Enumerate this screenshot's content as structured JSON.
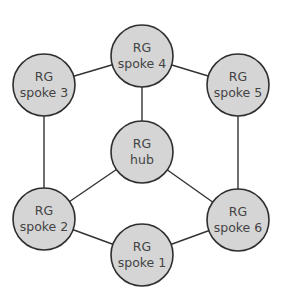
{
  "diagram": {
    "type": "network-topology",
    "style": {
      "node_fill": "#d5d5d5",
      "node_stroke": "#2e2e2e",
      "edge_color": "#333333",
      "text_color": "#444444",
      "background": "#ffffff"
    },
    "nodes": [
      {
        "id": "spoke4",
        "line1": "RG",
        "line2": "spoke 4",
        "cx": 142,
        "cy": 56
      },
      {
        "id": "spoke3",
        "line1": "RG",
        "line2": "spoke 3",
        "cx": 44,
        "cy": 85
      },
      {
        "id": "spoke5",
        "line1": "RG",
        "line2": "spoke 5",
        "cx": 238,
        "cy": 85
      },
      {
        "id": "hub",
        "line1": "RG",
        "line2": "hub",
        "cx": 142,
        "cy": 152
      },
      {
        "id": "spoke2",
        "line1": "RG",
        "line2": "spoke 2",
        "cx": 44,
        "cy": 219
      },
      {
        "id": "spoke6",
        "line1": "RG",
        "line2": "spoke 6",
        "cx": 238,
        "cy": 220
      },
      {
        "id": "spoke1",
        "line1": "RG",
        "line2": "spoke 1",
        "cx": 142,
        "cy": 255
      }
    ],
    "edges": [
      {
        "from": "spoke4",
        "to": "spoke3"
      },
      {
        "from": "spoke4",
        "to": "spoke5"
      },
      {
        "from": "spoke4",
        "to": "hub"
      },
      {
        "from": "spoke3",
        "to": "spoke2"
      },
      {
        "from": "spoke5",
        "to": "spoke6"
      },
      {
        "from": "hub",
        "to": "spoke2"
      },
      {
        "from": "hub",
        "to": "spoke6"
      },
      {
        "from": "spoke2",
        "to": "spoke1"
      },
      {
        "from": "spoke6",
        "to": "spoke1"
      }
    ]
  }
}
